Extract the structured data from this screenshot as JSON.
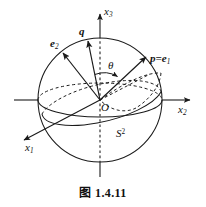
{
  "figure": {
    "caption": "图 1.4.11",
    "caption_prefix": "图",
    "caption_number": "1.4.11",
    "background_color": "#ffffff",
    "stroke_color": "#1a1a1a",
    "width": 206,
    "height": 207
  },
  "labels": {
    "axis_x3": {
      "base": "x",
      "sub": "3"
    },
    "axis_x2": {
      "base": "x",
      "sub": "2"
    },
    "axis_x1": {
      "base": "x",
      "sub": "1"
    },
    "vector_q": "q",
    "vector_e2": {
      "base": "e",
      "sub": "2"
    },
    "vector_p": {
      "lead": "p=",
      "base": "e",
      "sub": "1"
    },
    "origin": "O",
    "angle_theta": "θ",
    "sphere": {
      "base": "S",
      "sup": "2"
    }
  },
  "geometry": {
    "sphere_center": {
      "x": 100,
      "y": 100
    },
    "sphere_radius": 62,
    "origin_point": {
      "x": 100,
      "y": 100
    },
    "equator_rx": 62,
    "equator_ry": 17,
    "vectors": [
      {
        "name": "q",
        "tip": {
          "x": 88,
          "y": 41
        }
      },
      {
        "name": "e2",
        "tip": {
          "x": 62,
          "y": 52
        }
      },
      {
        "name": "p_e1",
        "tip": {
          "x": 146,
          "y": 57
        }
      }
    ],
    "theta_arc_radius": 26
  }
}
